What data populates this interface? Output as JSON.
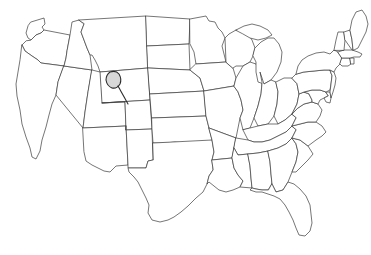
{
  "figure": {
    "kind": "outline-map",
    "region": "Contiguous United States",
    "width": 371,
    "height": 255,
    "background_color": "#ffffff",
    "outline_color": "#3b3b3b",
    "outline_width": 0.7,
    "has_labels": false,
    "has_legend": false,
    "has_title_text": false,
    "has_axes": false,
    "projection_note": "flat contiguous-48 silhouette, no Alaska or Hawaii shown"
  },
  "annotation": {
    "type": "highlighted-area-with-leader",
    "label": "",
    "host_state": "Wyoming",
    "fill_color": "#d8d8d8",
    "stroke_color": "#2a2a2a",
    "blob_center": {
      "x": 114,
      "y": 79
    },
    "blob_radius_x": 7,
    "blob_radius_y": 8,
    "leader_start": {
      "x": 118,
      "y": 86
    },
    "leader_end": {
      "x": 128,
      "y": 104
    }
  },
  "states": [
    {
      "code": "WA",
      "name": "Washington"
    },
    {
      "code": "OR",
      "name": "Oregon"
    },
    {
      "code": "CA",
      "name": "California"
    },
    {
      "code": "NV",
      "name": "Nevada"
    },
    {
      "code": "ID",
      "name": "Idaho"
    },
    {
      "code": "MT",
      "name": "Montana"
    },
    {
      "code": "WY",
      "name": "Wyoming"
    },
    {
      "code": "UT",
      "name": "Utah"
    },
    {
      "code": "AZ",
      "name": "Arizona"
    },
    {
      "code": "CO",
      "name": "Colorado"
    },
    {
      "code": "NM",
      "name": "New Mexico"
    },
    {
      "code": "ND",
      "name": "North Dakota"
    },
    {
      "code": "SD",
      "name": "South Dakota"
    },
    {
      "code": "NE",
      "name": "Nebraska"
    },
    {
      "code": "KS",
      "name": "Kansas"
    },
    {
      "code": "OK",
      "name": "Oklahoma"
    },
    {
      "code": "TX",
      "name": "Texas"
    },
    {
      "code": "MN",
      "name": "Minnesota"
    },
    {
      "code": "IA",
      "name": "Iowa"
    },
    {
      "code": "MO",
      "name": "Missouri"
    },
    {
      "code": "AR",
      "name": "Arkansas"
    },
    {
      "code": "LA",
      "name": "Louisiana"
    },
    {
      "code": "WI",
      "name": "Wisconsin"
    },
    {
      "code": "IL",
      "name": "Illinois"
    },
    {
      "code": "MI",
      "name": "Michigan"
    },
    {
      "code": "IN",
      "name": "Indiana"
    },
    {
      "code": "OH",
      "name": "Ohio"
    },
    {
      "code": "KY",
      "name": "Kentucky"
    },
    {
      "code": "TN",
      "name": "Tennessee"
    },
    {
      "code": "MS",
      "name": "Mississippi"
    },
    {
      "code": "AL",
      "name": "Alabama"
    },
    {
      "code": "GA",
      "name": "Georgia"
    },
    {
      "code": "FL",
      "name": "Florida"
    },
    {
      "code": "SC",
      "name": "South Carolina"
    },
    {
      "code": "NC",
      "name": "North Carolina"
    },
    {
      "code": "VA",
      "name": "Virginia"
    },
    {
      "code": "WV",
      "name": "West Virginia"
    },
    {
      "code": "MD",
      "name": "Maryland"
    },
    {
      "code": "DE",
      "name": "Delaware"
    },
    {
      "code": "PA",
      "name": "Pennsylvania"
    },
    {
      "code": "NJ",
      "name": "New Jersey"
    },
    {
      "code": "NY",
      "name": "New York"
    },
    {
      "code": "CT",
      "name": "Connecticut"
    },
    {
      "code": "RI",
      "name": "Rhode Island"
    },
    {
      "code": "MA",
      "name": "Massachusetts"
    },
    {
      "code": "VT",
      "name": "Vermont"
    },
    {
      "code": "NH",
      "name": "New Hampshire"
    },
    {
      "code": "ME",
      "name": "Maine"
    }
  ]
}
